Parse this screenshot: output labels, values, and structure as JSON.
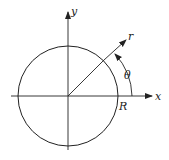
{
  "diagram": {
    "labels": {
      "x_axis": "x",
      "y_axis": "y",
      "radial": "r",
      "angle": "θ",
      "radius": "R"
    },
    "geometry": {
      "origin": [
        68,
        96
      ],
      "circle_radius": 50,
      "radial_angle_deg": 45,
      "angle_arc_radius": 64
    },
    "colors": {
      "stroke": "#222222",
      "background": "#ffffff"
    }
  }
}
